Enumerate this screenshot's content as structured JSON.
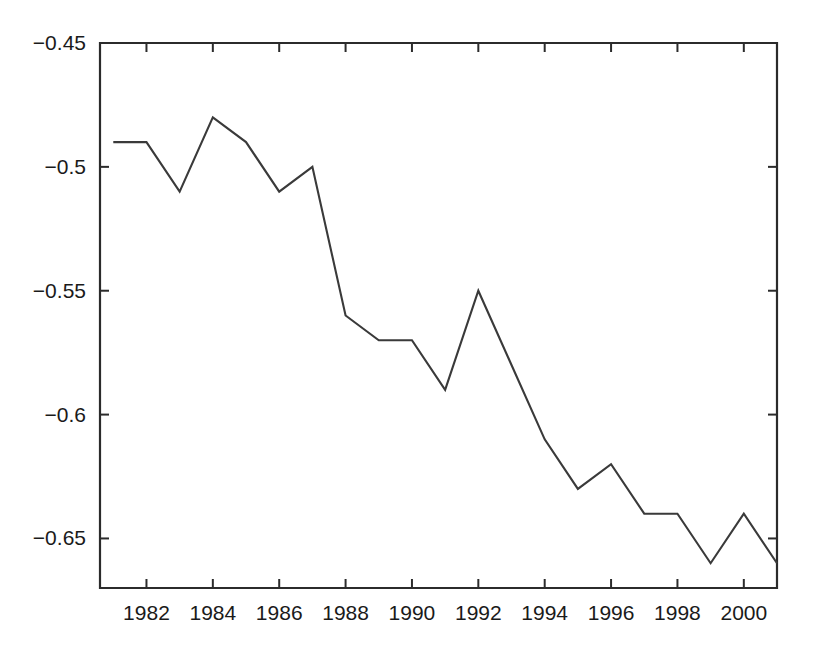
{
  "chart_data": {
    "type": "line",
    "title": "",
    "subtitle": "",
    "xlabel": "",
    "ylabel": "",
    "xlim": [
      1980.6,
      2001.0
    ],
    "ylim": [
      -0.67,
      -0.45
    ],
    "grid": false,
    "legend": null,
    "xticks": [
      1982,
      1984,
      1986,
      1988,
      1990,
      1992,
      1994,
      1996,
      1998,
      2000
    ],
    "xtick_labels": [
      "1982",
      "1984",
      "1986",
      "1988",
      "1990",
      "1992",
      "1994",
      "1996",
      "1998",
      "2000"
    ],
    "yticks": [
      -0.45,
      -0.5,
      -0.55,
      -0.6,
      -0.65
    ],
    "ytick_labels": [
      "−0.45",
      "−0.5",
      "−0.55",
      "−0.6",
      "−0.65"
    ],
    "x": [
      1981,
      1982,
      1983,
      1984,
      1985,
      1986,
      1987,
      1988,
      1989,
      1990,
      1991,
      1992,
      1993,
      1994,
      1995,
      1996,
      1997,
      1998,
      1999,
      2000,
      2001
    ],
    "values": [
      -0.49,
      -0.49,
      -0.51,
      -0.48,
      -0.49,
      -0.51,
      -0.5,
      -0.56,
      -0.57,
      -0.57,
      -0.59,
      -0.55,
      -0.58,
      -0.61,
      -0.63,
      -0.62,
      -0.64,
      -0.64,
      -0.66,
      -0.64,
      -0.66
    ],
    "series": [
      {
        "name": "series-1",
        "color": "#3a3a3a",
        "values": [
          -0.49,
          -0.49,
          -0.51,
          -0.48,
          -0.49,
          -0.51,
          -0.5,
          -0.56,
          -0.57,
          -0.57,
          -0.59,
          -0.55,
          -0.58,
          -0.61,
          -0.63,
          -0.62,
          -0.64,
          -0.64,
          -0.66,
          -0.64,
          -0.66
        ]
      }
    ],
    "colors": {
      "line": "#3a3a3a",
      "axis": "#2b2b2b",
      "text": "#1a1a1a",
      "background": "#ffffff"
    }
  }
}
